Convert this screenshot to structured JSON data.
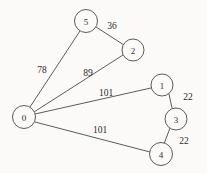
{
  "diagram": {
    "background_color": "#fbfaf8",
    "line_color": "#4a4a4a",
    "text_color": "#2a2a2a",
    "nodes": [
      {
        "id": "n0",
        "label": "0",
        "cx": 24,
        "cy": 117,
        "r": 11.5
      },
      {
        "id": "n1",
        "label": "1",
        "cx": 162,
        "cy": 85,
        "r": 11.0
      },
      {
        "id": "n2",
        "label": "2",
        "cx": 133,
        "cy": 50,
        "r": 11.0
      },
      {
        "id": "n3",
        "label": "3",
        "cx": 176,
        "cy": 119,
        "r": 11.0
      },
      {
        "id": "n4",
        "label": "4",
        "cx": 161,
        "cy": 154,
        "r": 11.5
      },
      {
        "id": "n5",
        "label": "5",
        "cx": 86,
        "cy": 21,
        "r": 11.5
      }
    ],
    "edges": [
      {
        "from": "0",
        "to": "5",
        "weight": "78",
        "x1": 30,
        "y1": 107,
        "x2": 80,
        "y2": 31,
        "lx": 42,
        "ly": 70
      },
      {
        "from": "5",
        "to": "2",
        "weight": "36",
        "x1": 96,
        "y1": 27,
        "x2": 124,
        "y2": 45,
        "lx": 112,
        "ly": 26
      },
      {
        "from": "0",
        "to": "2",
        "weight": "89",
        "x1": 34,
        "y1": 112,
        "x2": 123,
        "y2": 55,
        "lx": 88,
        "ly": 73
      },
      {
        "from": "0",
        "to": "1",
        "weight": "101",
        "x1": 35,
        "y1": 114,
        "x2": 151,
        "y2": 88,
        "lx": 106,
        "ly": 93
      },
      {
        "from": "1",
        "to": "3",
        "weight": "22",
        "x1": 169,
        "y1": 94,
        "x2": 172,
        "y2": 108,
        "lx": 188,
        "ly": 97
      },
      {
        "from": "3",
        "to": "4",
        "weight": "22",
        "x1": 170,
        "y1": 128,
        "x2": 164,
        "y2": 144,
        "lx": 184,
        "ly": 141
      },
      {
        "from": "0",
        "to": "4",
        "weight": "101",
        "x1": 35,
        "y1": 122,
        "x2": 150,
        "y2": 152,
        "lx": 100,
        "ly": 130
      }
    ]
  }
}
